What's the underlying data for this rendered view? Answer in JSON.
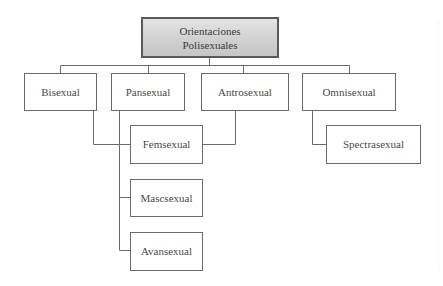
{
  "diagram": {
    "type": "hierarchy-tree",
    "root": {
      "label_line1": "Orientaciones",
      "label_line2": "Polisexuales"
    },
    "level1": [
      {
        "id": "bisexual",
        "label": "Bisexual"
      },
      {
        "id": "pansexual",
        "label": "Pansexual"
      },
      {
        "id": "antrosexual",
        "label": "Antrosexual"
      },
      {
        "id": "omnisexual",
        "label": "Omnisexual"
      }
    ],
    "level2": [
      {
        "id": "femsexual",
        "label": "Femsexual",
        "parents": [
          "bisexual",
          "pansexual",
          "antrosexual"
        ]
      },
      {
        "id": "mascsexual",
        "label": "Mascsexual",
        "parents": [
          "pansexual"
        ]
      },
      {
        "id": "avansexual",
        "label": "Avansexual",
        "parents": [
          "pansexual"
        ]
      },
      {
        "id": "spectrasexual",
        "label": "Spectrasexual",
        "parents": [
          "omnisexual"
        ]
      }
    ],
    "colors": {
      "root_fill_top": "#e4e4e4",
      "root_fill_bottom": "#c6c6c6",
      "border": "#6a6a6a",
      "connector": "#6a6a6a",
      "text": "#4a4a4a",
      "background": "#ffffff"
    }
  }
}
